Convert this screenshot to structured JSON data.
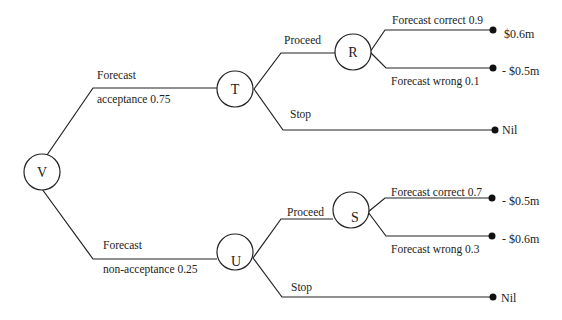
{
  "nodes": {
    "V": {
      "label": "V"
    },
    "T": {
      "label": "T"
    },
    "U": {
      "label": "U"
    },
    "R": {
      "label": "R"
    },
    "S": {
      "label": "S"
    }
  },
  "branches": {
    "acceptance": {
      "line1": "Forecast",
      "line2": "acceptance 0.75"
    },
    "non_acceptance": {
      "line1": "Forecast",
      "line2": "non-acceptance 0.25"
    },
    "t_proceed": {
      "label": "Proceed"
    },
    "t_stop": {
      "label": "Stop"
    },
    "u_proceed": {
      "label": "Proceed"
    },
    "u_stop": {
      "label": "Stop"
    },
    "r_correct": {
      "label": "Forecast correct 0.9"
    },
    "r_wrong": {
      "label": "Forecast wrong 0.1"
    },
    "s_correct": {
      "label": "Forecast correct 0.7"
    },
    "s_wrong": {
      "label": "Forecast wrong 0.3"
    }
  },
  "payoffs": {
    "r_correct": "$0.6m",
    "r_wrong": "- $0.5m",
    "t_stop": "Nil",
    "s_correct": "- $0.5m",
    "s_wrong": "- $0.6m",
    "u_stop": "Nil"
  },
  "colors": {
    "line": "#222222",
    "text": "#222222",
    "background": "#ffffff"
  }
}
